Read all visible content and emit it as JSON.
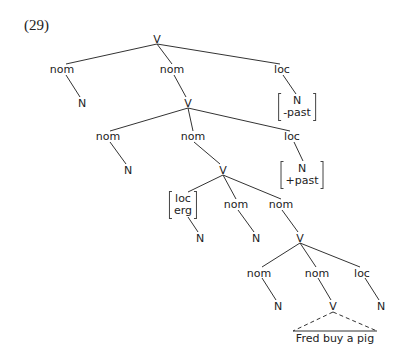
{
  "example_number": "(29)",
  "nodes": {
    "root_v": "V",
    "l1_nom1": "nom",
    "l1_nom2": "nom",
    "l1_loc": "loc",
    "l1_n": "N",
    "l1_v": "V",
    "l1_feat": [
      "N",
      "-past"
    ],
    "l2_nom1": "nom",
    "l2_nom2": "nom",
    "l2_loc": "loc",
    "l2_n": "N",
    "l2_v": "V",
    "l2_feat": [
      "N",
      "+past"
    ],
    "l3_feat": [
      "loc",
      "erg"
    ],
    "l3_nom1": "nom",
    "l3_nom2": "nom",
    "l3_n1": "N",
    "l3_n2": "N",
    "l3_v": "V",
    "l4_nom1": "nom",
    "l4_nom2": "nom",
    "l4_loc": "loc",
    "l4_n1": "N",
    "l4_v": "V",
    "l4_n2": "N",
    "terminal_string": "Fred buy a pig"
  }
}
